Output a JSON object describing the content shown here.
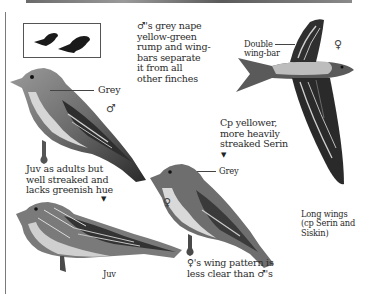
{
  "illustration": {
    "subject": "Finch field guide plate",
    "color_mode": "grayscale",
    "silhouettes_box": {
      "count": 2
    },
    "annotations": {
      "male_note": "♂'s grey nape\nyellow-green\nrump and wing-\nbars separate\nit from all\nother finches",
      "double_wing_bar": "Double\nwing-bar",
      "grey_male": "Grey",
      "grey_female": "Grey",
      "cp_yellower": "Cp yellower,\nmore heavily\nstreaked Serin",
      "juv_note": "Juv as adults but\nwell streaked and\nlacks greenish hue",
      "long_wings": "Long wings\n(cp Serin and\nSiskin)",
      "female_note": "♀'s wing pattern is\nless clear than ♂'s",
      "juv_label": "Juv"
    },
    "symbols": {
      "male": "♂",
      "female": "♀",
      "flight_female": "♀",
      "arrow_down": "▼"
    },
    "colors": {
      "ink": "#2b2b2b",
      "bird_dark": "#2e2e2e",
      "bird_mid": "#8a8a8a",
      "bird_light": "#d8d8d8",
      "paper": "#ffffff"
    }
  }
}
